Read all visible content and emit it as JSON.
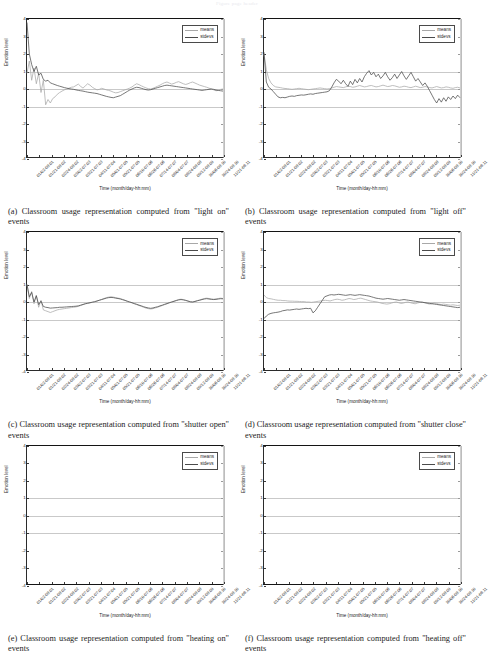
{
  "header_note": "Figure page header",
  "axis": {
    "ylabel": "Emotion level",
    "xlabel": "Time (month/day-hh:mm)",
    "yticks": [
      "4",
      "3",
      "2",
      "1",
      "0",
      "-1",
      "-2",
      "-3",
      "-4"
    ],
    "ylim": [
      -4,
      4
    ],
    "gridlines": [
      1,
      0,
      -1
    ],
    "xticks": [
      "01/02-08:01",
      "01/21-08:02",
      "02/24-08:02",
      "03/02-07:03",
      "03/21-07:03",
      "04/11-07:04",
      "05/01-07:05",
      "05/21-07:05",
      "06/10-07:06",
      "06/26-07:06",
      "07/14-07:07",
      "08/04-07:07",
      "08/24-08:08",
      "09/12-08:09",
      "10/06-08:10",
      "10/24-08:10",
      "11/21-08:11"
    ]
  },
  "legend": {
    "position": "upper right",
    "entries": [
      {
        "label": "means",
        "color": "#a8a8a8"
      },
      {
        "label": "stdevs",
        "color": "#4b4b4b"
      }
    ]
  },
  "figures": [
    {
      "tag": "(a)",
      "caption": "(a) Classroom usage representation computed from \"light on\" events"
    },
    {
      "tag": "(b)",
      "caption": "(b) Classroom usage representation computed from \"light off\" events"
    },
    {
      "tag": "(c)",
      "caption": "(c) Classroom usage representation computed from \"shutter open\" events"
    },
    {
      "tag": "(d)",
      "caption": "(d) Classroom usage representation computed from \"shutter close\" events"
    },
    {
      "tag": "(e)",
      "caption": "(e) Classroom usage representation computed from \"heating on\" events"
    },
    {
      "tag": "(f)",
      "caption": "(f) Classroom usage representation computed from \"heating off\" events"
    }
  ],
  "chart_data": [
    {
      "type": "line",
      "panel": "a",
      "title": "Classroom usage representation computed from \"light on\" events",
      "xlabel": "Time (month/day-hh:mm)",
      "ylabel": "Emotion level",
      "ylim": [
        -4,
        4
      ],
      "grid": true,
      "legend": "upper right",
      "series": [
        {
          "name": "means",
          "color": "#a8a8a8",
          "values": [
            0.9,
            1.6,
            0.5,
            1.2,
            0.3,
            0.9,
            -0.2,
            0.5,
            -0.9,
            -0.6,
            -0.8,
            -0.55,
            -0.45,
            -0.3,
            -0.2,
            -0.12,
            -0.05,
            0.0,
            0.05,
            0.1,
            0.12,
            0.2,
            0.28,
            0.15,
            0.05,
            0.18,
            0.3,
            0.22,
            0.1,
            0.02,
            -0.05,
            -0.02,
            0.04,
            0.0,
            -0.05,
            -0.08,
            -0.12,
            -0.18,
            -0.22,
            -0.2,
            -0.15,
            -0.1,
            -0.05,
            0.0,
            0.05,
            0.12,
            0.22,
            0.3,
            0.25,
            0.18,
            0.12,
            0.06,
            0.02,
            0.0,
            0.04,
            0.1,
            0.16,
            0.22,
            0.3,
            0.36,
            0.4,
            0.34,
            0.28,
            0.32,
            0.38,
            0.42,
            0.36,
            0.3,
            0.26,
            0.3,
            0.36,
            0.4,
            0.34,
            0.28,
            0.22,
            0.18,
            0.14,
            0.1,
            0.05,
            0.0,
            -0.05,
            -0.1,
            -0.08,
            -0.02,
            0.0
          ]
        },
        {
          "name": "stdevs",
          "color": "#4b4b4b",
          "values": [
            3.8,
            2.0,
            1.4,
            1.0,
            1.3,
            0.8,
            0.9,
            0.55,
            0.45,
            0.5,
            0.35,
            0.3,
            0.25,
            0.2,
            0.16,
            0.12,
            0.08,
            0.05,
            0.02,
            0.0,
            -0.02,
            -0.05,
            -0.08,
            -0.1,
            -0.12,
            -0.15,
            -0.18,
            -0.2,
            -0.22,
            -0.24,
            -0.26,
            -0.3,
            -0.34,
            -0.38,
            -0.42,
            -0.45,
            -0.48,
            -0.5,
            -0.46,
            -0.42,
            -0.38,
            -0.3,
            -0.22,
            -0.14,
            -0.06,
            0.0,
            0.06,
            0.1,
            0.08,
            0.04,
            0.0,
            -0.04,
            -0.06,
            -0.04,
            0.0,
            0.04,
            0.08,
            0.12,
            0.16,
            0.2,
            0.22,
            0.2,
            0.18,
            0.16,
            0.14,
            0.12,
            0.1,
            0.08,
            0.06,
            0.04,
            0.02,
            0.0,
            -0.02,
            -0.04,
            -0.06,
            -0.08,
            -0.06,
            -0.04,
            -0.02,
            0.0,
            -0.02,
            -0.06,
            -0.08,
            -0.1,
            -0.12
          ]
        }
      ]
    },
    {
      "type": "line",
      "panel": "b",
      "title": "Classroom usage representation computed from \"light off\" events",
      "xlabel": "Time (month/day-hh:mm)",
      "ylabel": "Emotion level",
      "ylim": [
        -4,
        4
      ],
      "grid": true,
      "legend": "upper right",
      "series": [
        {
          "name": "means",
          "color": "#a8a8a8",
          "values": [
            2.0,
            1.1,
            0.6,
            0.35,
            0.2,
            0.12,
            0.1,
            0.08,
            0.05,
            0.03,
            0.02,
            0.0,
            -0.02,
            0.0,
            0.02,
            0.04,
            0.02,
            0.0,
            -0.02,
            -0.04,
            -0.02,
            0.0,
            0.02,
            0.04,
            0.06,
            0.04,
            0.02,
            0.0,
            0.02,
            0.06,
            0.1,
            0.14,
            0.12,
            0.1,
            0.08,
            0.12,
            0.16,
            0.14,
            0.1,
            0.12,
            0.16,
            0.2,
            0.16,
            0.12,
            0.14,
            0.18,
            0.2,
            0.16,
            0.12,
            0.14,
            0.18,
            0.22,
            0.18,
            0.14,
            0.16,
            0.2,
            0.18,
            0.14,
            0.1,
            0.12,
            0.16,
            0.14,
            0.1,
            0.08,
            0.12,
            0.16,
            0.12,
            0.08,
            0.1,
            0.14,
            0.12,
            0.08,
            0.06,
            0.1,
            0.14,
            0.1,
            0.06,
            0.08,
            0.12,
            0.1,
            0.06,
            0.04,
            0.08,
            0.1,
            0.06
          ]
        },
        {
          "name": "stdevs",
          "color": "#4b4b4b",
          "values": [
            2.1,
            0.4,
            0.1,
            0.0,
            -0.15,
            -0.3,
            -0.45,
            -0.5,
            -0.48,
            -0.5,
            -0.46,
            -0.42,
            -0.4,
            -0.42,
            -0.38,
            -0.36,
            -0.34,
            -0.35,
            -0.33,
            -0.3,
            -0.28,
            -0.3,
            -0.26,
            -0.24,
            -0.22,
            -0.2,
            -0.18,
            -0.16,
            -0.1,
            0.1,
            0.35,
            0.55,
            0.45,
            0.3,
            0.5,
            0.3,
            0.15,
            0.45,
            0.25,
            0.55,
            0.35,
            0.6,
            0.4,
            0.7,
            0.9,
            1.05,
            0.8,
            0.95,
            0.7,
            0.85,
            0.6,
            0.75,
            0.95,
            0.7,
            0.5,
            0.65,
            0.85,
            0.6,
            0.8,
            1.0,
            0.75,
            0.55,
            0.75,
            0.95,
            0.7,
            0.45,
            0.6,
            0.4,
            0.2,
            0.35,
            0.15,
            -0.1,
            -0.35,
            -0.6,
            -0.8,
            -0.55,
            -0.75,
            -0.5,
            -0.7,
            -0.45,
            -0.6,
            -0.4,
            -0.55,
            -0.35,
            -0.5
          ]
        }
      ]
    },
    {
      "type": "line",
      "panel": "c",
      "title": "Classroom usage representation computed from \"shutter open\" events",
      "xlabel": "Time (month/day-hh:mm)",
      "ylabel": "Emotion level",
      "ylim": [
        -4,
        4
      ],
      "grid": true,
      "legend": "upper right",
      "series": [
        {
          "name": "means",
          "color": "#a8a8a8",
          "values": [
            1.0,
            0.2,
            0.6,
            -0.1,
            0.4,
            -0.3,
            0.1,
            -0.45,
            -0.5,
            -0.55,
            -0.6,
            -0.55,
            -0.5,
            -0.45,
            -0.42,
            -0.4,
            -0.38,
            -0.36,
            -0.34,
            -0.32,
            -0.3,
            -0.28,
            -0.25,
            -0.2,
            -0.15,
            -0.1,
            -0.08,
            -0.05,
            -0.02,
            0.0,
            0.05,
            0.1,
            0.15,
            0.2,
            0.25,
            0.28,
            0.3,
            0.28,
            0.25,
            0.22,
            0.2,
            0.15,
            0.1,
            0.05,
            0.0,
            -0.05,
            -0.1,
            -0.15,
            -0.2,
            -0.25,
            -0.3,
            -0.35,
            -0.38,
            -0.4,
            -0.38,
            -0.34,
            -0.3,
            -0.25,
            -0.2,
            -0.15,
            -0.1,
            -0.05,
            0.0,
            0.05,
            0.1,
            0.14,
            0.16,
            0.14,
            0.1,
            0.06,
            0.02,
            0.0,
            0.04,
            0.08,
            0.12,
            0.16,
            0.2,
            0.22,
            0.2,
            0.18,
            0.16,
            0.18,
            0.2,
            0.22,
            0.2
          ]
        },
        {
          "name": "stdevs",
          "color": "#4b4b4b",
          "values": [
            1.0,
            0.3,
            0.55,
            0.0,
            0.35,
            -0.15,
            0.05,
            -0.25,
            -0.3,
            -0.32,
            -0.35,
            -0.34,
            -0.33,
            -0.32,
            -0.3,
            -0.3,
            -0.29,
            -0.28,
            -0.27,
            -0.26,
            -0.25,
            -0.24,
            -0.22,
            -0.18,
            -0.14,
            -0.1,
            -0.07,
            -0.04,
            -0.01,
            0.02,
            0.06,
            0.1,
            0.14,
            0.18,
            0.22,
            0.25,
            0.26,
            0.25,
            0.22,
            0.2,
            0.17,
            0.13,
            0.09,
            0.04,
            0.0,
            -0.04,
            -0.09,
            -0.13,
            -0.18,
            -0.22,
            -0.27,
            -0.31,
            -0.34,
            -0.36,
            -0.34,
            -0.3,
            -0.27,
            -0.22,
            -0.18,
            -0.13,
            -0.09,
            -0.04,
            0.0,
            0.04,
            0.08,
            0.12,
            0.14,
            0.12,
            0.09,
            0.05,
            0.01,
            0.0,
            0.03,
            0.07,
            0.1,
            0.14,
            0.17,
            0.19,
            0.17,
            0.15,
            0.14,
            0.15,
            0.17,
            0.19,
            0.18
          ]
        }
      ]
    },
    {
      "type": "line",
      "panel": "d",
      "title": "Classroom usage representation computed from \"shutter close\" events",
      "xlabel": "Time (month/day-hh:mm)",
      "ylabel": "Emotion level",
      "ylim": [
        -4,
        4
      ],
      "grid": true,
      "legend": "upper right",
      "series": [
        {
          "name": "means",
          "color": "#a8a8a8",
          "values": [
            0.4,
            0.25,
            0.2,
            0.18,
            0.15,
            0.12,
            0.1,
            0.1,
            0.08,
            0.08,
            0.06,
            0.05,
            0.05,
            0.04,
            0.04,
            0.03,
            0.02,
            0.02,
            0.0,
            0.0,
            -0.02,
            0.0,
            0.02,
            0.04,
            0.06,
            0.08,
            0.1,
            0.08,
            0.06,
            0.1,
            0.14,
            0.16,
            0.14,
            0.1,
            0.12,
            0.16,
            0.2,
            0.18,
            0.14,
            0.16,
            0.2,
            0.22,
            0.18,
            0.14,
            0.1,
            0.06,
            0.04,
            0.02,
            0.0,
            -0.04,
            -0.08,
            -0.1,
            -0.12,
            -0.1,
            -0.06,
            -0.02,
            0.0,
            -0.04,
            -0.08,
            -0.06,
            -0.02,
            0.0,
            -0.04,
            -0.08,
            -0.1,
            -0.06,
            -0.02,
            0.0,
            -0.04,
            -0.08,
            -0.12,
            -0.1,
            -0.06,
            -0.08,
            -0.12,
            -0.14,
            -0.12,
            -0.14,
            -0.16,
            -0.18,
            -0.16,
            -0.18,
            -0.2,
            -0.18
          ]
        },
        {
          "name": "stdevs",
          "color": "#4b4b4b",
          "values": [
            -0.95,
            -0.8,
            -0.7,
            -0.65,
            -0.62,
            -0.6,
            -0.58,
            -0.55,
            -0.5,
            -0.48,
            -0.45,
            -0.46,
            -0.44,
            -0.42,
            -0.4,
            -0.42,
            -0.4,
            -0.38,
            -0.36,
            -0.38,
            -0.36,
            -0.62,
            -0.5,
            -0.3,
            -0.1,
            0.1,
            0.3,
            0.35,
            0.4,
            0.42,
            0.4,
            0.42,
            0.44,
            0.42,
            0.4,
            0.38,
            0.4,
            0.42,
            0.4,
            0.38,
            0.4,
            0.42,
            0.4,
            0.38,
            0.36,
            0.34,
            0.3,
            0.26,
            0.22,
            0.2,
            0.18,
            0.16,
            0.18,
            0.2,
            0.18,
            0.16,
            0.14,
            0.12,
            0.1,
            0.12,
            0.14,
            0.12,
            0.1,
            0.08,
            0.06,
            0.04,
            0.02,
            0.0,
            -0.02,
            -0.04,
            -0.06,
            -0.08,
            -0.1,
            -0.12,
            -0.14,
            -0.16,
            -0.18,
            -0.2,
            -0.22,
            -0.24,
            -0.26,
            -0.28,
            -0.3,
            -0.32,
            -0.3
          ]
        }
      ]
    },
    {
      "type": "line",
      "panel": "e",
      "title": "Classroom usage representation computed from \"heating on\" events",
      "xlabel": "Time (month/day-hh:mm)",
      "ylabel": "Emotion level",
      "ylim": [
        -4,
        4
      ],
      "grid": true,
      "legend": "upper right",
      "series": [
        {
          "name": "means",
          "color": "#a8a8a8",
          "values": []
        },
        {
          "name": "stdevs",
          "color": "#4b4b4b",
          "values": []
        }
      ],
      "note": "no data plotted"
    },
    {
      "type": "line",
      "panel": "f",
      "title": "Classroom usage representation computed from \"heating off\" events",
      "xlabel": "Time (month/day-hh:mm)",
      "ylabel": "Emotion level",
      "ylim": [
        -4,
        4
      ],
      "grid": true,
      "legend": "upper right",
      "series": [
        {
          "name": "means",
          "color": "#a8a8a8",
          "values": []
        },
        {
          "name": "stdevs",
          "color": "#4b4b4b",
          "values": []
        }
      ],
      "note": "no data plotted"
    }
  ]
}
